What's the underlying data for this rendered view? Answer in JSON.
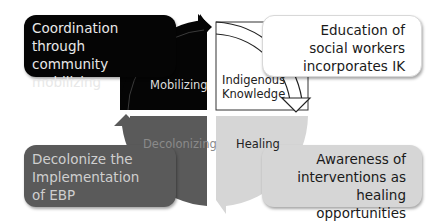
{
  "diagram": {
    "type": "four-quadrant cycle",
    "quadrants": [
      {
        "id": "top-left",
        "label": "Mobilizing",
        "fill": "#050505",
        "text_color": "#dcdcdc"
      },
      {
        "id": "top-right",
        "label_line1": "Indigenous",
        "label_line2": "Knowledge",
        "fill": "#ffffff",
        "text_color": "#222222"
      },
      {
        "id": "bottom-right",
        "label": "Healing",
        "fill": "#d6d6d6",
        "text_color": "#222222"
      },
      {
        "id": "bottom-left",
        "label": "Decolonizing",
        "fill": "#5a5a5a",
        "text_color": "#8a8a8a"
      }
    ],
    "boxes": {
      "top_left": {
        "line1": "Coordination through",
        "line2": "community",
        "line3": "mobilizing"
      },
      "top_right": {
        "line1": "Education of",
        "line2": "social workers",
        "line3": "incorporates IK"
      },
      "bottom_right": {
        "line1": "Awareness of",
        "line2": "interventions as",
        "line3": "healing opportunities"
      },
      "bottom_left": {
        "line1": "Decolonize the",
        "line2": "Implementation",
        "line3": "of EBP"
      }
    }
  }
}
